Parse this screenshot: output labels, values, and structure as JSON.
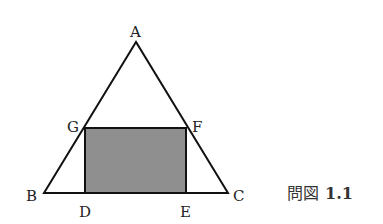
{
  "figure": {
    "caption_prefix": "問図",
    "caption_number": "1.1",
    "colors": {
      "line": "#111111",
      "rect_fill": "#8f8f8f",
      "background": "#ffffff"
    },
    "points": {
      "A": {
        "label": "A",
        "x": 136,
        "y": 42
      },
      "B": {
        "label": "B",
        "x": 44,
        "y": 193
      },
      "C": {
        "label": "C",
        "x": 228,
        "y": 193
      },
      "D": {
        "label": "D",
        "x": 85,
        "y": 193
      },
      "E": {
        "label": "E",
        "x": 186,
        "y": 193
      },
      "F": {
        "label": "F",
        "x": 186,
        "y": 128
      },
      "G": {
        "label": "G",
        "x": 85,
        "y": 128
      }
    },
    "shapes": {
      "triangle": [
        "A",
        "B",
        "C"
      ],
      "shaded_rectangle": [
        "D",
        "E",
        "F",
        "G"
      ]
    }
  }
}
